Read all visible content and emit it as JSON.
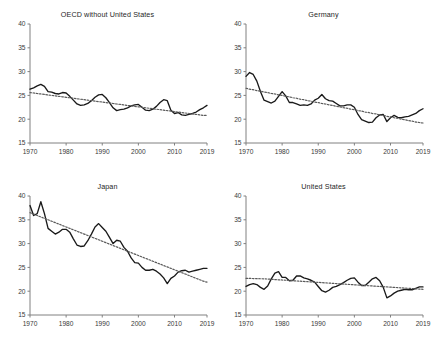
{
  "figure": {
    "background": "#ffffff",
    "series_color": "#1a1a1a",
    "trend_color": "#5a5a5a",
    "axis_color": "#808080",
    "layout": "2x2-grid",
    "panel_order": [
      "oecd_without_us",
      "germany",
      "japan",
      "united_states"
    ]
  },
  "axes": {
    "ylim": [
      15,
      40
    ],
    "yticks": [
      40,
      35,
      30,
      25,
      20,
      15
    ],
    "ytick_labels": [
      "40",
      "35",
      "30",
      "25",
      "20",
      "15"
    ],
    "xlim": [
      1970,
      2019
    ],
    "xticks": [
      1970,
      1980,
      1990,
      2000,
      2010,
      2019
    ],
    "xtick_labels": [
      "1970",
      "1980",
      "1990",
      "2000",
      "2010",
      "2019"
    ],
    "grid": false,
    "legend": "none"
  },
  "chart_data": [
    {
      "type": "line",
      "title": "OECD without United States",
      "xlabel": "",
      "ylabel": "",
      "xlim": [
        1970,
        2019
      ],
      "ylim": [
        15,
        40
      ],
      "x": [
        1970,
        1971,
        1972,
        1973,
        1974,
        1975,
        1976,
        1977,
        1978,
        1979,
        1980,
        1981,
        1982,
        1983,
        1984,
        1985,
        1986,
        1987,
        1988,
        1989,
        1990,
        1991,
        1992,
        1993,
        1994,
        1995,
        1996,
        1997,
        1998,
        1999,
        2000,
        2001,
        2002,
        2003,
        2004,
        2005,
        2006,
        2007,
        2008,
        2009,
        2010,
        2011,
        2012,
        2013,
        2014,
        2015,
        2016,
        2017,
        2018,
        2019
      ],
      "series": [
        {
          "name": "Investment rate",
          "style": "solid",
          "values": [
            26.3,
            26.6,
            27.0,
            27.3,
            26.9,
            25.8,
            25.7,
            25.4,
            25.3,
            25.6,
            25.5,
            24.8,
            24.0,
            23.2,
            22.9,
            23.0,
            23.3,
            23.9,
            24.6,
            25.1,
            25.2,
            24.5,
            23.5,
            22.4,
            21.8,
            22.0,
            22.1,
            22.4,
            22.8,
            23.0,
            23.1,
            22.5,
            21.9,
            21.8,
            22.1,
            22.7,
            23.5,
            24.1,
            23.9,
            21.9,
            21.2,
            21.4,
            20.9,
            20.8,
            21.0,
            21.2,
            21.5,
            22.0,
            22.4,
            22.9
          ]
        },
        {
          "name": "Linear trend",
          "style": "dotted",
          "values": [
            25.6,
            25.5,
            25.4,
            25.3,
            25.2,
            25.1,
            25.0,
            24.9,
            24.8,
            24.7,
            24.6,
            24.5,
            24.4,
            24.3,
            24.2,
            24.1,
            24.0,
            23.9,
            23.8,
            23.7,
            23.6,
            23.5,
            23.4,
            23.3,
            23.2,
            23.1,
            23.0,
            22.9,
            22.8,
            22.7,
            22.6,
            22.5,
            22.4,
            22.3,
            22.2,
            22.1,
            22.0,
            21.9,
            21.8,
            21.7,
            21.6,
            21.5,
            21.4,
            21.3,
            21.2,
            21.1,
            21.0,
            20.9,
            20.8,
            20.8
          ]
        }
      ]
    },
    {
      "type": "line",
      "title": "Germany",
      "xlabel": "",
      "ylabel": "",
      "xlim": [
        1970,
        2019
      ],
      "ylim": [
        15,
        40
      ],
      "x": [
        1970,
        1971,
        1972,
        1973,
        1974,
        1975,
        1976,
        1977,
        1978,
        1979,
        1980,
        1981,
        1982,
        1983,
        1984,
        1985,
        1986,
        1987,
        1988,
        1989,
        1990,
        1991,
        1992,
        1993,
        1994,
        1995,
        1996,
        1997,
        1998,
        1999,
        2000,
        2001,
        2002,
        2003,
        2004,
        2005,
        2006,
        2007,
        2008,
        2009,
        2010,
        2011,
        2012,
        2013,
        2014,
        2015,
        2016,
        2017,
        2018,
        2019
      ],
      "series": [
        {
          "name": "Investment rate",
          "style": "solid",
          "values": [
            29.0,
            29.8,
            29.4,
            28.0,
            25.8,
            24.0,
            23.7,
            23.4,
            23.8,
            24.8,
            25.8,
            24.9,
            23.5,
            23.5,
            23.2,
            22.9,
            23.0,
            22.9,
            23.2,
            24.0,
            24.4,
            25.2,
            24.3,
            23.9,
            23.8,
            23.3,
            22.8,
            22.8,
            23.0,
            23.0,
            22.5,
            21.0,
            19.9,
            19.6,
            19.3,
            19.4,
            20.3,
            20.9,
            21.0,
            19.5,
            20.3,
            20.8,
            20.4,
            20.3,
            20.5,
            20.6,
            20.9,
            21.2,
            21.8,
            22.2
          ]
        },
        {
          "name": "Linear trend",
          "style": "dotted",
          "values": [
            26.5,
            26.3,
            26.2,
            26.0,
            25.9,
            25.7,
            25.6,
            25.4,
            25.3,
            25.1,
            25.0,
            24.8,
            24.7,
            24.5,
            24.4,
            24.2,
            24.1,
            23.9,
            23.8,
            23.6,
            23.5,
            23.3,
            23.2,
            23.0,
            22.9,
            22.7,
            22.6,
            22.4,
            22.3,
            22.1,
            22.0,
            21.8,
            21.7,
            21.5,
            21.4,
            21.2,
            21.1,
            20.9,
            20.8,
            20.6,
            20.5,
            20.3,
            20.2,
            20.0,
            19.9,
            19.7,
            19.6,
            19.4,
            19.3,
            19.2
          ]
        }
      ]
    },
    {
      "type": "line",
      "title": "Japan",
      "xlabel": "",
      "ylabel": "",
      "xlim": [
        1970,
        2019
      ],
      "ylim": [
        15,
        40
      ],
      "x": [
        1970,
        1971,
        1972,
        1973,
        1974,
        1975,
        1976,
        1977,
        1978,
        1979,
        1980,
        1981,
        1982,
        1983,
        1984,
        1985,
        1986,
        1987,
        1988,
        1989,
        1990,
        1991,
        1992,
        1993,
        1994,
        1995,
        1996,
        1997,
        1998,
        1999,
        2000,
        2001,
        2002,
        2003,
        2004,
        2005,
        2006,
        2007,
        2008,
        2009,
        2010,
        2011,
        2012,
        2013,
        2014,
        2015,
        2016,
        2017,
        2018,
        2019
      ],
      "series": [
        {
          "name": "Investment rate",
          "style": "solid",
          "values": [
            38.0,
            35.9,
            36.3,
            38.8,
            36.3,
            33.2,
            32.6,
            32.0,
            32.4,
            33.0,
            33.0,
            32.4,
            31.0,
            29.7,
            29.4,
            29.5,
            30.6,
            32.0,
            33.5,
            34.2,
            33.4,
            32.6,
            31.3,
            30.0,
            30.7,
            30.5,
            29.2,
            28.4,
            27.0,
            26.0,
            25.9,
            25.0,
            24.4,
            24.4,
            24.6,
            24.2,
            23.6,
            22.8,
            21.6,
            22.7,
            23.2,
            24.0,
            24.3,
            24.4,
            24.0,
            24.2,
            24.4,
            24.6,
            24.8,
            24.8
          ]
        },
        {
          "name": "Linear trend",
          "style": "dotted",
          "values": [
            36.5,
            36.2,
            35.9,
            35.6,
            35.3,
            35.0,
            34.7,
            34.4,
            34.1,
            33.8,
            33.5,
            33.2,
            32.9,
            32.6,
            32.3,
            32.0,
            31.7,
            31.4,
            31.1,
            30.8,
            30.5,
            30.2,
            29.9,
            29.6,
            29.3,
            29.0,
            28.7,
            28.4,
            28.1,
            27.8,
            27.5,
            27.2,
            26.9,
            26.6,
            26.3,
            26.0,
            25.7,
            25.4,
            25.1,
            24.8,
            24.5,
            24.2,
            23.9,
            23.6,
            23.3,
            23.0,
            22.7,
            22.4,
            22.1,
            21.9
          ]
        }
      ]
    },
    {
      "type": "line",
      "title": "United States",
      "xlabel": "",
      "ylabel": "",
      "xlim": [
        1970,
        2019
      ],
      "ylim": [
        15,
        40
      ],
      "x": [
        1970,
        1971,
        1972,
        1973,
        1974,
        1975,
        1976,
        1977,
        1978,
        1979,
        1980,
        1981,
        1982,
        1983,
        1984,
        1985,
        1986,
        1987,
        1988,
        1989,
        1990,
        1991,
        1992,
        1993,
        1994,
        1995,
        1996,
        1997,
        1998,
        1999,
        2000,
        2001,
        2002,
        2003,
        2004,
        2005,
        2006,
        2007,
        2008,
        2009,
        2010,
        2011,
        2012,
        2013,
        2014,
        2015,
        2016,
        2017,
        2018,
        2019
      ],
      "series": [
        {
          "name": "Investment rate",
          "style": "solid",
          "values": [
            21.0,
            21.4,
            21.6,
            21.4,
            20.8,
            20.4,
            21.1,
            22.6,
            23.8,
            24.1,
            22.9,
            22.9,
            22.2,
            22.3,
            23.2,
            23.2,
            22.8,
            22.6,
            22.3,
            21.9,
            21.0,
            20.1,
            19.8,
            20.2,
            20.8,
            21.0,
            21.4,
            21.8,
            22.3,
            22.7,
            22.8,
            21.9,
            21.2,
            21.2,
            21.9,
            22.6,
            22.9,
            22.2,
            20.8,
            18.6,
            19.0,
            19.6,
            20.0,
            20.2,
            20.4,
            20.3,
            20.3,
            20.6,
            20.9,
            20.9
          ]
        },
        {
          "name": "Linear trend",
          "style": "dotted",
          "values": [
            22.7,
            22.68,
            22.66,
            22.64,
            22.62,
            22.6,
            22.55,
            22.5,
            22.45,
            22.4,
            22.35,
            22.3,
            22.25,
            22.2,
            22.15,
            22.1,
            22.05,
            22.0,
            21.95,
            21.9,
            21.85,
            21.8,
            21.75,
            21.7,
            21.65,
            21.6,
            21.55,
            21.5,
            21.45,
            21.4,
            21.35,
            21.3,
            21.25,
            21.2,
            21.15,
            21.1,
            21.05,
            21.0,
            20.95,
            20.9,
            20.85,
            20.8,
            20.75,
            20.7,
            20.65,
            20.6,
            20.55,
            20.5,
            20.45,
            20.4
          ]
        }
      ]
    }
  ]
}
